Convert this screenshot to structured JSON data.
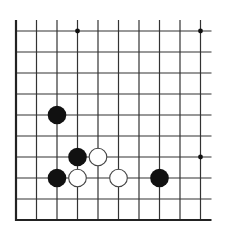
{
  "diagram": {
    "type": "go-board-diagram",
    "region": "lower-left corner",
    "columns": 10,
    "rows": 10,
    "colors": {
      "background": "#ffffff",
      "line": "#333333",
      "edge": "#222222",
      "black_stone": "#111111",
      "white_stone_fill": "#ffffff",
      "white_stone_stroke": "#444444",
      "star_point": "#111111"
    },
    "closed_edges": [
      "left",
      "bottom"
    ],
    "star_points": [
      {
        "col": 3,
        "row": 0
      },
      {
        "col": 9,
        "row": 0
      },
      {
        "col": 9,
        "row": 6
      }
    ],
    "stones": [
      {
        "color": "black",
        "col": 2,
        "row": 4
      },
      {
        "color": "black",
        "col": 3,
        "row": 6
      },
      {
        "color": "white",
        "col": 4,
        "row": 6
      },
      {
        "color": "black",
        "col": 2,
        "row": 7
      },
      {
        "color": "white",
        "col": 3,
        "row": 7
      },
      {
        "color": "white",
        "col": 5,
        "row": 7
      },
      {
        "color": "black",
        "col": 7,
        "row": 7
      }
    ]
  }
}
